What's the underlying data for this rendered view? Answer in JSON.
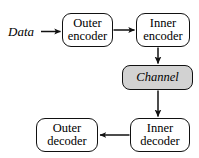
{
  "diagram": {
    "background_color": "#ffffff",
    "stroke_color": "#111111",
    "shaded_fill_color": "#d2d2d2",
    "input_label": "Data",
    "nodes": [
      {
        "id": "outer-encoder",
        "line1": "Outer",
        "line2": "encoder",
        "shaded": false
      },
      {
        "id": "inner-encoder",
        "line1": "Inner",
        "line2": "encoder",
        "shaded": false
      },
      {
        "id": "channel",
        "line1": "Channel",
        "line2": "",
        "shaded": true
      },
      {
        "id": "inner-decoder",
        "line1": "Inner",
        "line2": "decoder",
        "shaded": false
      },
      {
        "id": "outer-decoder",
        "line1": "Outer",
        "line2": "decoder",
        "shaded": false
      }
    ],
    "edges": [
      {
        "id": "data-to-outer-encoder",
        "direction": "right"
      },
      {
        "id": "outer-encoder-to-inner-encoder",
        "direction": "right"
      },
      {
        "id": "inner-encoder-to-channel",
        "direction": "down"
      },
      {
        "id": "channel-to-inner-decoder",
        "direction": "down"
      },
      {
        "id": "inner-decoder-to-outer-decoder",
        "direction": "left"
      }
    ]
  }
}
